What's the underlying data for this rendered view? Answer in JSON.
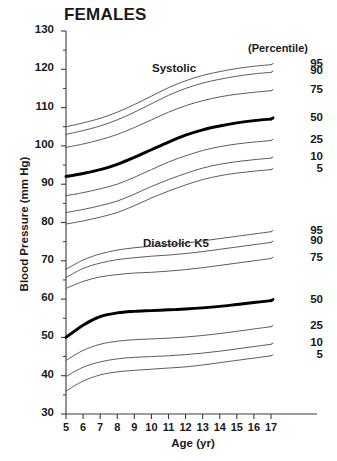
{
  "chart_data": {
    "type": "line",
    "title": "FEMALES",
    "xlabel": "Age (yr)",
    "ylabel": "Blood Pressure (mm Hg)",
    "xlim": [
      5,
      17
    ],
    "ylim": [
      30,
      130
    ],
    "grid": false,
    "legend_position": "right",
    "legend_header": "(Percentile)",
    "x_ticks": [
      5,
      6,
      7,
      8,
      9,
      10,
      11,
      12,
      13,
      14,
      15,
      16,
      17
    ],
    "y_ticks": [
      30,
      40,
      50,
      60,
      70,
      80,
      90,
      100,
      110,
      120,
      130
    ],
    "y_minor_tick_step": 5,
    "x": [
      5,
      6,
      7,
      8,
      9,
      10,
      11,
      12,
      13,
      14,
      15,
      16,
      17
    ],
    "groups": [
      {
        "name": "Systolic",
        "annotation": "Systolic",
        "series": [
          {
            "name": "95",
            "percentile": 95,
            "emphasis": false,
            "values": [
              105.0,
              106.0,
              107.2,
              108.8,
              110.8,
              113.0,
              115.2,
              117.0,
              118.4,
              119.4,
              120.2,
              120.8,
              121.2
            ]
          },
          {
            "name": "90",
            "percentile": 90,
            "emphasis": false,
            "values": [
              103.0,
              104.0,
              105.2,
              106.8,
              108.8,
              111.0,
              113.2,
              115.0,
              116.4,
              117.4,
              118.2,
              118.8,
              119.2
            ]
          },
          {
            "name": "75",
            "percentile": 75,
            "emphasis": false,
            "values": [
              99.6,
              100.5,
              101.6,
              103.0,
              104.8,
              106.8,
              108.8,
              110.5,
              111.8,
              112.8,
              113.5,
              114.0,
              114.4
            ]
          },
          {
            "name": "50",
            "percentile": 50,
            "emphasis": true,
            "values": [
              92.0,
              92.8,
              93.8,
              95.2,
              97.0,
              99.0,
              101.0,
              102.8,
              104.2,
              105.2,
              106.0,
              106.6,
              107.0
            ]
          },
          {
            "name": "25",
            "percentile": 25,
            "emphasis": false,
            "values": [
              87.0,
              87.8,
              88.8,
              90.0,
              91.8,
              93.8,
              95.8,
              97.4,
              98.8,
              99.8,
              100.5,
              101.0,
              101.4
            ]
          },
          {
            "name": "10",
            "percentile": 10,
            "emphasis": false,
            "values": [
              82.6,
              83.4,
              84.4,
              85.6,
              87.4,
              89.4,
              91.2,
              92.8,
              94.2,
              95.2,
              95.9,
              96.4,
              96.8
            ]
          },
          {
            "name": "5",
            "percentile": 5,
            "emphasis": false,
            "values": [
              79.6,
              80.4,
              81.4,
              82.6,
              84.4,
              86.4,
              88.2,
              89.8,
              91.2,
              92.2,
              92.9,
              93.4,
              93.8
            ]
          }
        ]
      },
      {
        "name": "Diastolic K5",
        "annotation": "Diastolic K5",
        "series": [
          {
            "name": "95",
            "percentile": 95,
            "emphasis": false,
            "values": [
              67.8,
              70.2,
              71.8,
              72.8,
              73.4,
              73.8,
              74.2,
              74.6,
              75.2,
              75.8,
              76.4,
              77.0,
              77.6
            ]
          },
          {
            "name": "90",
            "percentile": 90,
            "emphasis": false,
            "values": [
              65.6,
              68.0,
              69.4,
              70.3,
              70.8,
              71.2,
              71.5,
              71.9,
              72.4,
              73.0,
              73.6,
              74.2,
              74.8
            ]
          },
          {
            "name": "75",
            "percentile": 75,
            "emphasis": false,
            "values": [
              62.8,
              64.6,
              65.8,
              66.4,
              66.8,
              67.0,
              67.3,
              67.7,
              68.2,
              68.8,
              69.4,
              70.0,
              70.6
            ]
          },
          {
            "name": "50",
            "percentile": 50,
            "emphasis": true,
            "values": [
              50.0,
              53.2,
              55.4,
              56.4,
              56.8,
              57.0,
              57.2,
              57.4,
              57.7,
              58.1,
              58.6,
              59.1,
              59.6
            ]
          },
          {
            "name": "25",
            "percentile": 25,
            "emphasis": false,
            "values": [
              44.0,
              46.6,
              48.2,
              49.0,
              49.4,
              49.6,
              49.8,
              50.1,
              50.5,
              51.0,
              51.6,
              52.2,
              52.8
            ]
          },
          {
            "name": "10",
            "percentile": 10,
            "emphasis": false,
            "values": [
              39.8,
              42.2,
              43.6,
              44.4,
              44.8,
              45.0,
              45.2,
              45.5,
              45.9,
              46.4,
              47.0,
              47.6,
              48.2
            ]
          },
          {
            "name": "5",
            "percentile": 5,
            "emphasis": false,
            "values": [
              36.0,
              38.6,
              40.2,
              41.0,
              41.4,
              41.7,
              42.0,
              42.3,
              42.8,
              43.4,
              44.0,
              44.6,
              45.2
            ]
          }
        ]
      }
    ]
  },
  "colors": {
    "axis": "#3a3a3a",
    "curve": "#4a4a4a",
    "curve_emphasis": "#000000",
    "text": "#1a1a1a",
    "background": "#ffffff"
  }
}
